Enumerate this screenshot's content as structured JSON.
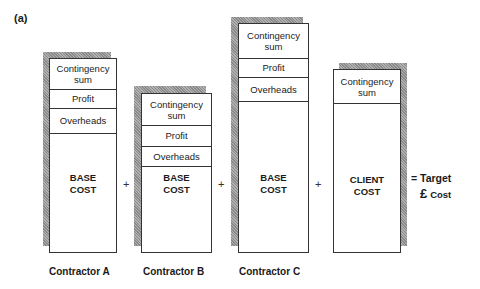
{
  "panel_label": "(a)",
  "contractors": [
    {
      "name": "Contractor A",
      "segments": [
        "Contingency sum",
        "Profit",
        "Overheads"
      ],
      "base_line1": "BASE",
      "base_line2": "COST"
    },
    {
      "name": "Contractor B",
      "segments": [
        "Contingency sum",
        "Profit",
        "Overheads"
      ],
      "base_line1": "BASE",
      "base_line2": "COST"
    },
    {
      "name": "Contractor C",
      "segments": [
        "Contingency sum",
        "Profit",
        "Overheads"
      ],
      "base_line1": "BASE",
      "base_line2": "COST"
    }
  ],
  "client": {
    "segments": [
      "Contingency sum"
    ],
    "base_line1": "CLIENT",
    "base_line2": "COST"
  },
  "operators": [
    "+",
    "+",
    "+"
  ],
  "result": {
    "line1": "= Target",
    "currency": "£",
    "line2": "Cost"
  }
}
